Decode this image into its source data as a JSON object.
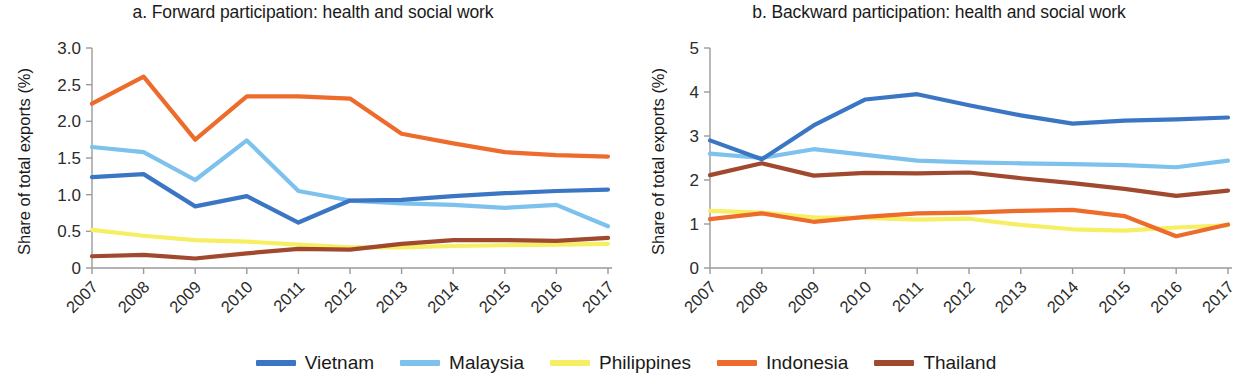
{
  "figure": {
    "ylabel": "Share of total exports (%)",
    "legend": [
      {
        "name": "Vietnam",
        "color": "#3b76c4"
      },
      {
        "name": "Malaysia",
        "color": "#7cc2ec"
      },
      {
        "name": "Philippines",
        "color": "#f6ef63"
      },
      {
        "name": "Indonesia",
        "color": "#ed6b2b"
      },
      {
        "name": "Thailand",
        "color": "#a0492f"
      }
    ]
  },
  "chart_data": [
    {
      "type": "line",
      "title": "a. Forward participation: health and social work",
      "xlabel": "",
      "ylabel": "Share of total exports (%)",
      "x": [
        "2007",
        "2008",
        "2009",
        "2010",
        "2011",
        "2012",
        "2013",
        "2014",
        "2015",
        "2016",
        "2017"
      ],
      "ylim": [
        0,
        3.0
      ],
      "yticks": [
        "0",
        "0.5",
        "1.0",
        "1.5",
        "2.0",
        "2.5",
        "3.0"
      ],
      "ytick_values": [
        0,
        0.5,
        1.0,
        1.5,
        2.0,
        2.5,
        3.0
      ],
      "grid": false,
      "legend_position": "bottom",
      "series": [
        {
          "name": "Vietnam",
          "color": "#3b76c4",
          "values": [
            1.24,
            1.28,
            0.84,
            0.98,
            0.62,
            0.92,
            0.93,
            0.98,
            1.02,
            1.05,
            1.07
          ]
        },
        {
          "name": "Malaysia",
          "color": "#7cc2ec",
          "values": [
            1.65,
            1.58,
            1.2,
            1.74,
            1.05,
            0.92,
            0.88,
            0.86,
            0.82,
            0.86,
            0.57
          ]
        },
        {
          "name": "Philippines",
          "color": "#f6ef63",
          "values": [
            0.52,
            0.44,
            0.38,
            0.36,
            0.32,
            0.28,
            0.28,
            0.3,
            0.31,
            0.32,
            0.33
          ]
        },
        {
          "name": "Indonesia",
          "color": "#ed6b2b",
          "values": [
            2.24,
            2.61,
            1.75,
            2.34,
            2.34,
            2.31,
            1.83,
            1.7,
            1.58,
            1.54,
            1.52
          ]
        },
        {
          "name": "Thailand",
          "color": "#a0492f",
          "values": [
            0.16,
            0.18,
            0.13,
            0.2,
            0.26,
            0.25,
            0.33,
            0.38,
            0.38,
            0.37,
            0.41
          ]
        }
      ]
    },
    {
      "type": "line",
      "title": "b. Backward participation: health and social work",
      "xlabel": "",
      "ylabel": "Share of total exports (%)",
      "x": [
        "2007",
        "2008",
        "2009",
        "2010",
        "2011",
        "2012",
        "2013",
        "2014",
        "2015",
        "2016",
        "2017"
      ],
      "ylim": [
        0,
        5
      ],
      "yticks": [
        "0",
        "1",
        "2",
        "3",
        "4",
        "5"
      ],
      "ytick_values": [
        0,
        1,
        2,
        3,
        4,
        5
      ],
      "grid": false,
      "legend_position": "bottom",
      "series": [
        {
          "name": "Vietnam",
          "color": "#3b76c4",
          "values": [
            2.9,
            2.47,
            3.24,
            3.83,
            3.95,
            3.7,
            3.47,
            3.28,
            3.35,
            3.38,
            3.42
          ]
        },
        {
          "name": "Malaysia",
          "color": "#7cc2ec",
          "values": [
            2.6,
            2.5,
            2.7,
            2.57,
            2.44,
            2.4,
            2.38,
            2.36,
            2.34,
            2.29,
            2.44
          ]
        },
        {
          "name": "Philippines",
          "color": "#f6ef63",
          "values": [
            1.3,
            1.26,
            1.15,
            1.14,
            1.1,
            1.12,
            0.98,
            0.88,
            0.85,
            0.92,
            0.97
          ]
        },
        {
          "name": "Indonesia",
          "color": "#ed6b2b",
          "values": [
            1.11,
            1.24,
            1.05,
            1.16,
            1.24,
            1.26,
            1.3,
            1.32,
            1.18,
            0.72,
            0.99
          ]
        },
        {
          "name": "Thailand",
          "color": "#a0492f",
          "values": [
            2.11,
            2.38,
            2.1,
            2.16,
            2.15,
            2.17,
            2.04,
            1.93,
            1.8,
            1.64,
            1.76
          ]
        }
      ]
    }
  ]
}
